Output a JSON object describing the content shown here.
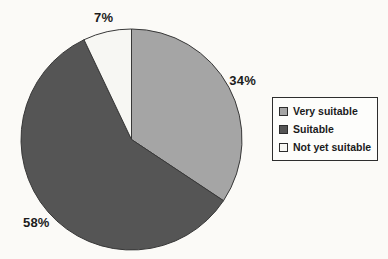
{
  "chart_data": {
    "type": "pie",
    "title": "",
    "labels": [
      "Very suitable",
      "Suitable",
      "Not yet suitable"
    ],
    "values": [
      34,
      58,
      7
    ],
    "display_labels": [
      "34%",
      "58%",
      "7%"
    ],
    "colors": [
      "#a5a5a5",
      "#555555",
      "#f7f7f3"
    ],
    "outline_color": "#383838",
    "start_angle_deg": 0,
    "direction": "clockwise",
    "legend_position": "right",
    "grid": false
  }
}
